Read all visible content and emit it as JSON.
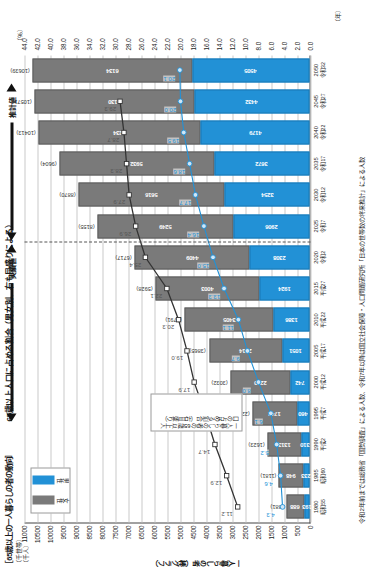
{
  "headings": {
    "bracket_title": "［65歳以上の一人暮らしの者の動向］",
    "main_title": "65歳以上人口に占める割合（男女別、右も目盛りによる）",
    "unit_left_line1": "（千世帯）",
    "unit_left_line2": "（千人）",
    "unit_right": "（％）",
    "unit_year": "（年）",
    "axis_name_left": "一人暮らしの者（棒グラフ）"
  },
  "legend": {
    "female_label": "女性",
    "male_label": "男性",
    "female_color": "#7a7a7a",
    "male_color": "#2291d6"
  },
  "callouts": {
    "ratio": "一人暮らしの者の65歳以上人口の占める割合（右目盛り）",
    "divider_left": "実績値",
    "divider_right": "推計値"
  },
  "source": "令和2年前までは総務省「国勢調査」による人数、令和7年以降は国立社会保障・人口問題研究所「日本の世帯数の将来推計」による人数",
  "axes": {
    "left_ticks": [
      11000,
      10500,
      10000,
      9500,
      9000,
      8500,
      8000,
      7500,
      7000,
      6500,
      6000,
      5500,
      5000,
      4500,
      4000,
      3500,
      3000,
      2500,
      2000,
      1500,
      1000,
      500,
      0
    ],
    "right_ticks": [
      44.0,
      42.0,
      40.0,
      38.0,
      36.0,
      34.0,
      32.0,
      30.0,
      28.0,
      26.0,
      24.0,
      22.0,
      20.0,
      18.0,
      16.0,
      14.0,
      12.0,
      10.0,
      8.0,
      6.0,
      4.0,
      2.0,
      0.0
    ],
    "left_max": 11000,
    "right_max": 44.0
  },
  "chart_data": {
    "type": "bar",
    "title": "65歳以上人口に占める割合（男女別、右も目盛りによる）",
    "xlabel": "（年）",
    "ylabel": "一人暮らしの者（棒グラフ）",
    "ylim": [
      0,
      11000
    ],
    "y2lim": [
      0,
      44.0
    ],
    "grid": true,
    "legend_position": "top-left",
    "categories": [
      "1980",
      "1985",
      "1990",
      "1995",
      "2000",
      "2005",
      "2010",
      "2015",
      "2020",
      "2025",
      "2030",
      "2035",
      "2040",
      "2045",
      "2050"
    ],
    "era_labels": [
      "昭和55",
      "昭和60",
      "平成2",
      "平成7",
      "平成12",
      "平成17",
      "平成22",
      "平成27",
      "令和2",
      "令和7",
      "令和12",
      "令和17",
      "令和22",
      "令和27",
      "令和32"
    ],
    "series": [
      {
        "name": "男性",
        "color": "#2291d6",
        "values": [
          193,
          233,
          310,
          460,
          742,
          1051,
          1386,
          1924,
          2308,
          2906,
          3254,
          3672,
          4179,
          4432,
          4505
        ]
      },
      {
        "name": "女性",
        "color": "#7a7a7a",
        "values": [
          688,
          948,
          1313,
          1742,
          2290,
          2814,
          3405,
          4003,
          4409,
          5249,
          5616,
          5932,
          6234,
          6130,
          6134
        ]
      }
    ],
    "totals": [
      "(881)",
      "(1181)",
      "(1623)",
      "(2202)",
      "(3032)",
      "(3865)",
      "(4791)",
      "(5928)",
      "(6717)",
      "(8155)",
      "(8870)",
      "(9604)",
      "(10413)",
      "(10571)",
      "(10639)"
    ],
    "lines": [
      {
        "name": "一人暮らしの者の65歳以上人口に占める割合（計）",
        "color": "#333333",
        "marker": "square",
        "values": [
          11.2,
          12.9,
          14.7,
          16.2,
          17.9,
          19.0,
          20.3,
          22.1,
          25.4,
          26.9,
          27.9,
          28.3,
          28.7,
          29.3,
          null
        ]
      },
      {
        "name": "男性割合",
        "color": "#2291d6",
        "marker": "circle",
        "values": [
          4.3,
          4.6,
          5.2,
          6.1,
          8.0,
          9.7,
          11.1,
          13.3,
          15.0,
          16.4,
          17.7,
          18.6,
          19.5,
          20.0,
          20.1
        ]
      }
    ],
    "line_labels_dark": [
      "11.2",
      "12.9",
      "14.7",
      "16.2",
      "17.9",
      "19.0",
      "20.3",
      "22.1",
      "25.4",
      "26.9",
      "27.9",
      "28.3",
      "28.7",
      "29.3"
    ],
    "line_labels_blue": [
      "4.3",
      "4.6",
      "5.2",
      "6.1",
      "8.0",
      "9.7",
      "11.1",
      "13.3",
      "15.0",
      "16.4",
      "17.7",
      "18.6",
      "19.5",
      "20.0",
      "20.1"
    ],
    "actual_through": "2020",
    "estimate_from": "2025"
  }
}
